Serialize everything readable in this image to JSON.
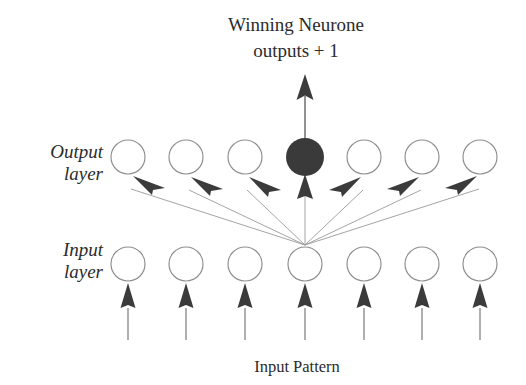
{
  "figure": {
    "title_line1": "Winning Neurone",
    "title_line2": "outputs + 1",
    "bottom_label": "Input Pattern",
    "output_layer_label_line1": "Output",
    "output_layer_label_line2": "layer",
    "input_layer_label_line1": "Input",
    "input_layer_label_line2": "layer"
  },
  "colors": {
    "background": "#ffffff",
    "text": "#2b2b2b",
    "node_outline": "#8d8d8d",
    "node_fill": "#ffffff",
    "winner_fill": "#3a3a3a",
    "connection_line": "#9a9a9a",
    "arrow_head": "#3b3b3b",
    "stem": "#6e6e6e"
  },
  "geometry": {
    "width": 526,
    "height": 385,
    "node_radius": 17,
    "column_x": [
      128,
      186,
      245,
      305,
      364,
      422,
      480
    ],
    "output_row_y": 157,
    "input_row_y": 264,
    "fan_origin_x": 305,
    "fan_origin_y": 245
  },
  "network": {
    "output_layer": {
      "count": 7,
      "nodes": [
        {
          "index": 0,
          "state": "open",
          "winner": false
        },
        {
          "index": 1,
          "state": "open",
          "winner": false
        },
        {
          "index": 2,
          "state": "open",
          "winner": false
        },
        {
          "index": 3,
          "state": "filled",
          "winner": true
        },
        {
          "index": 4,
          "state": "open",
          "winner": false
        },
        {
          "index": 5,
          "state": "open",
          "winner": false
        },
        {
          "index": 6,
          "state": "open",
          "winner": false
        }
      ]
    },
    "input_layer": {
      "count": 7,
      "nodes": [
        {
          "index": 0,
          "state": "open"
        },
        {
          "index": 1,
          "state": "open"
        },
        {
          "index": 2,
          "state": "open"
        },
        {
          "index": 3,
          "state": "open"
        },
        {
          "index": 4,
          "state": "open"
        },
        {
          "index": 5,
          "state": "open"
        },
        {
          "index": 6,
          "state": "open"
        }
      ]
    },
    "connections": {
      "type": "fan-out",
      "from": "input-layer-center-node",
      "to_all_output_nodes": true,
      "count": 7,
      "arrowheads": true
    },
    "input_arrows": {
      "count": 7,
      "direction": "up",
      "label": "Input Pattern"
    },
    "winner_output_arrow": {
      "direction": "up",
      "from": "winning-neurone",
      "label": "Winning Neurone outputs + 1"
    }
  }
}
